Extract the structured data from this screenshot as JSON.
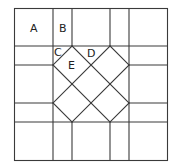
{
  "diagram": {
    "type": "geometric-tiling",
    "stroke_color": "#3a3a3a",
    "background": "#ffffff",
    "labels": [
      {
        "id": "A",
        "text": "A",
        "x": 30,
        "y": 32
      },
      {
        "id": "B",
        "text": "B",
        "x": 59,
        "y": 32
      },
      {
        "id": "C",
        "text": "C",
        "x": 54,
        "y": 56
      },
      {
        "id": "D",
        "text": "D",
        "x": 87,
        "y": 57
      },
      {
        "id": "E",
        "text": "E",
        "x": 68,
        "y": 69
      }
    ]
  }
}
